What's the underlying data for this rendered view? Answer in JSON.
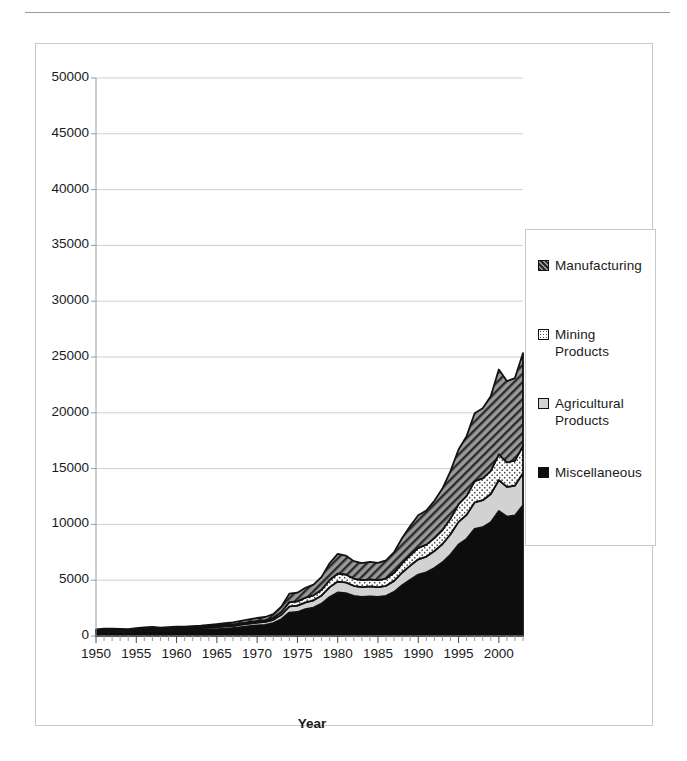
{
  "figure": {
    "frame": true,
    "top_rule": true
  },
  "chart_data": {
    "type": "area",
    "stacked": true,
    "title": "",
    "xlabel": "Year",
    "ylabel": "",
    "xlim": [
      1950,
      2003
    ],
    "ylim": [
      0,
      50000
    ],
    "grid": "horizontal",
    "legend_position": "right",
    "ytick_labels": [
      "50000",
      "45000",
      "40000",
      "35000",
      "30000",
      "25000",
      "20000",
      "15000",
      "10000",
      "5000",
      "0"
    ],
    "ytick_values": [
      50000,
      45000,
      40000,
      35000,
      30000,
      25000,
      20000,
      15000,
      10000,
      5000,
      0
    ],
    "xtick_labels": [
      "1950",
      "1955",
      "1960",
      "1965",
      "1970",
      "1975",
      "1980",
      "1985",
      "1990",
      "1995",
      "2000"
    ],
    "xtick_values": [
      1950,
      1955,
      1960,
      1965,
      1970,
      1975,
      1980,
      1985,
      1990,
      1995,
      2000
    ],
    "x": [
      1950,
      1951,
      1952,
      1953,
      1954,
      1955,
      1956,
      1957,
      1958,
      1959,
      1960,
      1961,
      1962,
      1963,
      1964,
      1965,
      1966,
      1967,
      1968,
      1969,
      1970,
      1971,
      1972,
      1973,
      1974,
      1975,
      1976,
      1977,
      1978,
      1979,
      1980,
      1981,
      1982,
      1983,
      1984,
      1985,
      1986,
      1987,
      1988,
      1989,
      1990,
      1991,
      1992,
      1993,
      1994,
      1995,
      1996,
      1997,
      1998,
      1999,
      2000,
      2001,
      2002,
      2003
    ],
    "series": [
      {
        "name": "Miscellaneous",
        "fill": "solid-black",
        "color": "#0d0d0d",
        "values": [
          330,
          370,
          360,
          355,
          345,
          400,
          450,
          470,
          430,
          450,
          480,
          490,
          510,
          540,
          580,
          620,
          670,
          720,
          800,
          880,
          950,
          1000,
          1150,
          1500,
          2100,
          2150,
          2400,
          2550,
          2900,
          3500,
          3900,
          3850,
          3600,
          3500,
          3550,
          3500,
          3600,
          3950,
          4550,
          5050,
          5500,
          5700,
          6100,
          6600,
          7300,
          8200,
          8700,
          9600,
          9750,
          10200,
          11200,
          10700,
          10800,
          11700
        ]
      },
      {
        "name": "Agricultural Products",
        "fill": "light-gray",
        "color": "#d2d2d2",
        "values": [
          120,
          130,
          125,
          120,
          115,
          130,
          140,
          145,
          140,
          145,
          150,
          150,
          155,
          160,
          170,
          180,
          190,
          200,
          215,
          230,
          250,
          265,
          300,
          400,
          560,
          570,
          620,
          650,
          730,
          880,
          980,
          960,
          900,
          880,
          890,
          880,
          900,
          990,
          1140,
          1260,
          1370,
          1420,
          1520,
          1640,
          1820,
          2030,
          2160,
          2380,
          2420,
          2530,
          2780,
          2660,
          2680,
          2900
        ]
      },
      {
        "name": "Mining Products",
        "fill": "dotted-white",
        "color": "#fafafa",
        "values": [
          60,
          65,
          65,
          60,
          58,
          66,
          72,
          75,
          70,
          73,
          77,
          78,
          80,
          84,
          90,
          96,
          104,
          112,
          124,
          136,
          148,
          156,
          178,
          250,
          370,
          380,
          420,
          450,
          520,
          640,
          720,
          700,
          650,
          630,
          640,
          630,
          650,
          720,
          840,
          940,
          1030,
          1070,
          1150,
          1250,
          1400,
          1580,
          1700,
          1900,
          1950,
          2060,
          2300,
          2200,
          2230,
          2450
        ]
      },
      {
        "name": "Manufacturing",
        "fill": "diagonal-hatch",
        "color": "#8f8f8f",
        "values": [
          90,
          100,
          100,
          95,
          92,
          105,
          115,
          120,
          115,
          120,
          128,
          130,
          135,
          142,
          152,
          164,
          178,
          194,
          216,
          240,
          265,
          280,
          325,
          480,
          760,
          780,
          880,
          960,
          1150,
          1500,
          1760,
          1700,
          1560,
          1520,
          1560,
          1550,
          1620,
          1850,
          2250,
          2600,
          2920,
          3050,
          3350,
          3720,
          4250,
          4900,
          5350,
          6080,
          6280,
          6700,
          7600,
          7280,
          7400,
          8300
        ]
      }
    ],
    "stack_totals_note": "values are per-series increments stacked bottom to top: Miscellaneous, Agricultural Products, Mining Products, Manufacturing",
    "stack_totals": [
      600,
      665,
      650,
      630,
      610,
      701,
      777,
      810,
      755,
      788,
      835,
      848,
      880,
      926,
      992,
      1060,
      1142,
      1226,
      1355,
      1486,
      1613,
      1701,
      1953,
      2630,
      3790,
      3880,
      4320,
      4610,
      5300,
      6520,
      7360,
      7210,
      6710,
      6530,
      6640,
      6560,
      6770,
      7510,
      8780,
      9850,
      10820,
      11240,
      12120,
      13210,
      14770,
      16710,
      17910,
      19960,
      20400,
      21490,
      23880,
      22840,
      23110,
      25350
    ]
  },
  "legend": {
    "entries": [
      {
        "label": "Manufacturing",
        "swatch": "diagonal-hatch"
      },
      {
        "label": "Mining\nProducts",
        "swatch": "dotted-white"
      },
      {
        "label": "Agricultural\nProducts",
        "swatch": "light-gray"
      },
      {
        "label": "Miscellaneous",
        "swatch": "solid-black"
      }
    ]
  },
  "axis_titles": {
    "x": "Year"
  },
  "colors": {
    "grid": "#cfcfcf",
    "axis": "#9a9a9a",
    "frame": "#c9c9c9",
    "outline": "#111111",
    "text": "#1a1a1a"
  }
}
